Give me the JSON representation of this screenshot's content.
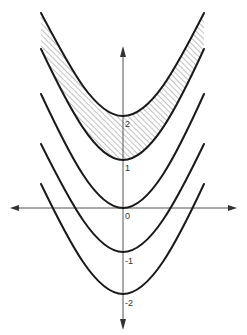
{
  "figure": {
    "axes": {
      "origin_label": "0",
      "y_tick_labels": [
        "2",
        "1",
        "0",
        "-1",
        "-2"
      ],
      "x_arrows": "both",
      "y_arrows": "both"
    },
    "curves": [
      {
        "name": "curve-c-2",
        "vertex_value": 2
      },
      {
        "name": "curve-c-1",
        "vertex_value": 1
      },
      {
        "name": "curve-c-0",
        "vertex_value": 0
      },
      {
        "name": "curve-c-minus-1",
        "vertex_value": -1
      },
      {
        "name": "curve-c-minus-2",
        "vertex_value": -2
      }
    ],
    "shaded_region": "between curve with vertex 1 and curve with vertex 2",
    "labels": {
      "two": "2",
      "one": "1",
      "zero": "0",
      "minus_one": "-1",
      "minus_two": "-2"
    }
  }
}
